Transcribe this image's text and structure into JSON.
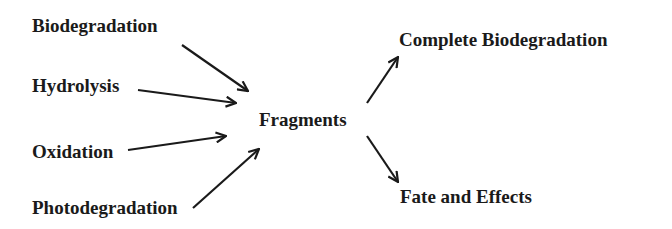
{
  "diagram": {
    "sources": [
      {
        "id": "biodegradation",
        "label": "Biodegradation"
      },
      {
        "id": "hydrolysis",
        "label": "Hydrolysis"
      },
      {
        "id": "oxidation",
        "label": "Oxidation"
      },
      {
        "id": "photodegradation",
        "label": "Photodegradation"
      }
    ],
    "center": {
      "id": "fragments",
      "label": "Fragments"
    },
    "outcomes": [
      {
        "id": "complete-biodegradation",
        "label": "Complete Biodegradation"
      },
      {
        "id": "fate-and-effects",
        "label": "Fate and Effects"
      }
    ],
    "edges": [
      {
        "from": "biodegradation",
        "to": "fragments"
      },
      {
        "from": "hydrolysis",
        "to": "fragments"
      },
      {
        "from": "oxidation",
        "to": "fragments"
      },
      {
        "from": "photodegradation",
        "to": "fragments"
      },
      {
        "from": "fragments",
        "to": "complete-biodegradation"
      },
      {
        "from": "fragments",
        "to": "fate-and-effects"
      }
    ],
    "colors": {
      "text": "#1a1a1a",
      "arrow": "#1a1a1a",
      "background": "#ffffff"
    }
  }
}
